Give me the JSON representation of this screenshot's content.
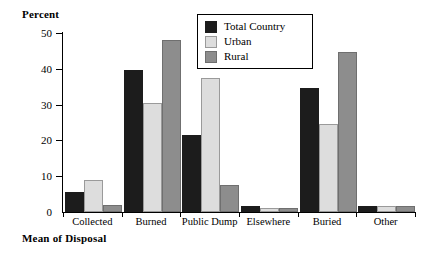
{
  "chart_data": {
    "type": "bar",
    "title": "",
    "xlabel": "Mean of Disposal",
    "ylabel": "Percent",
    "ylim": [
      0,
      50
    ],
    "yticks": [
      0,
      10,
      20,
      30,
      40,
      50
    ],
    "grid": false,
    "legend_position": "top-center",
    "categories": [
      "Collected",
      "Burned",
      "Public Dump",
      "Elsewhere",
      "Buried",
      "Other"
    ],
    "series": [
      {
        "name": "Total Country",
        "color": "#1c1c1c",
        "values": [
          5,
          39,
          21,
          1,
          34,
          1
        ]
      },
      {
        "name": "Urban",
        "color": "#dddddd",
        "values": [
          8.5,
          30,
          37,
          0.5,
          24,
          1
        ]
      },
      {
        "name": "Rural",
        "color": "#8d8d8d",
        "values": [
          1.5,
          47.5,
          7,
          0.5,
          44,
          1
        ]
      }
    ]
  },
  "axis": {
    "y_label": "Percent",
    "x_label": "Mean of Disposal",
    "y_tick_labels": [
      "0",
      "10",
      "20",
      "30",
      "40",
      "50"
    ]
  },
  "legend": {
    "entries": [
      {
        "label": "Total Country",
        "swatch": "total"
      },
      {
        "label": "Urban",
        "swatch": "urban"
      },
      {
        "label": "Rural",
        "swatch": "rural"
      }
    ]
  }
}
